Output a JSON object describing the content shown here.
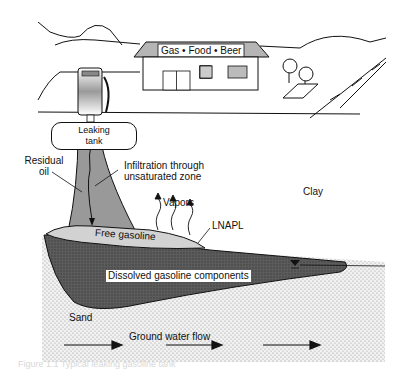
{
  "diagram": {
    "scene": {
      "store_sign": "Gas • Food • Beer"
    },
    "labels": {
      "leaking_tank_line1": "Leaking",
      "leaking_tank_line2": "tank",
      "residual_oil_line1": "Residual",
      "residual_oil_line2": "oil",
      "infiltration_line1": "Infiltration through",
      "infiltration_line2": "unsaturated zone",
      "vapors": "Vapors",
      "lnapl": "LNAPL",
      "clay": "Clay",
      "free_gasoline": "Free gasoline",
      "dissolved": "Dissolved gasoline components",
      "sand": "Sand",
      "ground_water_flow": "Ground water flow"
    },
    "caption": "Figure 1.1  Typical leaking gasoline tank"
  }
}
